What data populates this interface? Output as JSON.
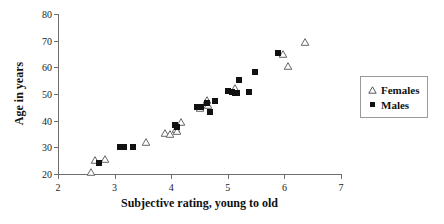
{
  "chart_data": {
    "type": "scatter",
    "title": "",
    "xlabel": "Subjective rating, young to old",
    "ylabel": "Age in years",
    "xlim": [
      2,
      7
    ],
    "ylim": [
      20,
      80
    ],
    "xticks": [
      2,
      3,
      4,
      5,
      6,
      7
    ],
    "yticks": [
      20,
      30,
      40,
      50,
      60,
      70,
      80
    ],
    "xtick_labels": [
      "2",
      "3",
      "4",
      "5",
      "6",
      "7"
    ],
    "ytick_labels": [
      "20",
      "30",
      "40",
      "50",
      "60",
      "70",
      "80"
    ],
    "grid": false,
    "legend_position": "right-outside",
    "series": [
      {
        "name": "Females",
        "marker": "open-triangle",
        "color": "#ffffff",
        "edge_color": "#555555",
        "points": [
          [
            2.58,
            20.8
          ],
          [
            2.66,
            25.2
          ],
          [
            2.83,
            25.6
          ],
          [
            3.55,
            32.0
          ],
          [
            3.89,
            35.2
          ],
          [
            3.97,
            35.0
          ],
          [
            4.08,
            37.0
          ],
          [
            4.11,
            36.2
          ],
          [
            4.17,
            39.5
          ],
          [
            4.5,
            44.6
          ],
          [
            4.63,
            47.8
          ],
          [
            4.65,
            46.0
          ],
          [
            5.13,
            52.2
          ],
          [
            5.98,
            64.9
          ],
          [
            6.07,
            60.4
          ],
          [
            6.37,
            69.6
          ]
        ]
      },
      {
        "name": "Males",
        "marker": "filled-square",
        "color": "#111111",
        "edge_color": "#111111",
        "points": [
          [
            2.73,
            24.1
          ],
          [
            3.09,
            30.2
          ],
          [
            3.13,
            30.1
          ],
          [
            3.17,
            30.0
          ],
          [
            3.33,
            30.2
          ],
          [
            4.07,
            38.2
          ],
          [
            4.11,
            37.6
          ],
          [
            4.46,
            45.3
          ],
          [
            4.52,
            45.0
          ],
          [
            4.64,
            46.8
          ],
          [
            4.68,
            43.4
          ],
          [
            4.78,
            47.4
          ],
          [
            5.0,
            51.2
          ],
          [
            5.07,
            50.6
          ],
          [
            5.12,
            50.3
          ],
          [
            5.17,
            50.5
          ],
          [
            5.2,
            55.2
          ],
          [
            5.37,
            50.9
          ],
          [
            5.48,
            58.4
          ],
          [
            5.88,
            65.5
          ]
        ]
      }
    ]
  },
  "legend": {
    "entries": [
      {
        "label": "Females",
        "marker": "open-triangle"
      },
      {
        "label": "Males",
        "marker": "filled-square"
      }
    ]
  }
}
